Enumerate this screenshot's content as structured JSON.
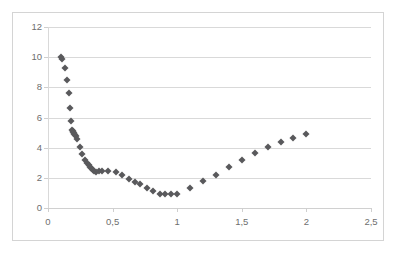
{
  "chart": {
    "type": "scatter",
    "title": "",
    "marker_color": "#59595c",
    "grid_color": "#d9d9d9",
    "border_color": "#d4d4d4",
    "axis_label_color": "#6e6e6e",
    "decimal_separator": ","
  },
  "chart_data": {
    "type": "scatter",
    "title": "",
    "xlabel": "",
    "ylabel": "",
    "xlim": [
      0,
      2.5
    ],
    "ylim": [
      0,
      12
    ],
    "xticks": [
      0,
      0.5,
      1,
      1.5,
      2,
      2.5
    ],
    "yticks": [
      0,
      2,
      4,
      6,
      8,
      10,
      12
    ],
    "xtick_labels": [
      "0",
      "0,5",
      "1",
      "1,5",
      "2",
      "2,5"
    ],
    "ytick_labels": [
      "0",
      "2",
      "4",
      "6",
      "8",
      "10",
      "12"
    ],
    "grid": "horizontal",
    "legend": "none",
    "series": [
      {
        "name": "series1",
        "marker": "diamond",
        "color": "#59595c",
        "points": [
          [
            0.1,
            10.0
          ],
          [
            0.11,
            9.85
          ],
          [
            0.13,
            9.3
          ],
          [
            0.15,
            8.5
          ],
          [
            0.16,
            7.62
          ],
          [
            0.17,
            6.62
          ],
          [
            0.175,
            5.8
          ],
          [
            0.185,
            5.2
          ],
          [
            0.19,
            5.1
          ],
          [
            0.195,
            5.05
          ],
          [
            0.2,
            4.95
          ],
          [
            0.205,
            4.9
          ],
          [
            0.21,
            4.85
          ],
          [
            0.215,
            4.8
          ],
          [
            0.225,
            4.55
          ],
          [
            0.245,
            4.05
          ],
          [
            0.265,
            3.55
          ],
          [
            0.285,
            3.2
          ],
          [
            0.3,
            3.0
          ],
          [
            0.315,
            2.85
          ],
          [
            0.325,
            2.72
          ],
          [
            0.335,
            2.62
          ],
          [
            0.345,
            2.52
          ],
          [
            0.355,
            2.45
          ],
          [
            0.375,
            2.4
          ],
          [
            0.395,
            2.42
          ],
          [
            0.415,
            2.42
          ],
          [
            0.465,
            2.48
          ],
          [
            0.525,
            2.38
          ],
          [
            0.575,
            2.2
          ],
          [
            0.625,
            1.95
          ],
          [
            0.675,
            1.75
          ],
          [
            0.715,
            1.6
          ],
          [
            0.765,
            1.35
          ],
          [
            0.815,
            1.12
          ],
          [
            0.865,
            0.95
          ],
          [
            0.905,
            0.95
          ],
          [
            0.955,
            0.95
          ],
          [
            1.0,
            0.95
          ],
          [
            1.1,
            1.35
          ],
          [
            1.2,
            1.78
          ],
          [
            1.3,
            2.2
          ],
          [
            1.4,
            2.7
          ],
          [
            1.5,
            3.18
          ],
          [
            1.6,
            3.62
          ],
          [
            1.7,
            4.02
          ],
          [
            1.8,
            4.38
          ],
          [
            1.9,
            4.65
          ],
          [
            2.0,
            4.9
          ]
        ]
      }
    ]
  }
}
